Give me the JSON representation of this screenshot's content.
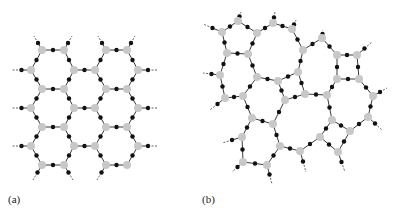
{
  "figure": {
    "panels": [
      {
        "id": "a",
        "label": "(a)",
        "description": "Crystalline network (ordered hexagonal rings)",
        "label_pos": [
          8,
          203
        ],
        "nodes": [
          [
            42,
            50
          ],
          [
            64,
            50
          ],
          [
            106,
            50
          ],
          [
            127,
            50
          ],
          [
            31,
            70
          ],
          [
            74,
            70
          ],
          [
            95,
            70
          ],
          [
            138,
            70
          ],
          [
            42,
            89
          ],
          [
            64,
            89
          ],
          [
            106,
            89
          ],
          [
            127,
            89
          ],
          [
            31,
            108
          ],
          [
            74,
            108
          ],
          [
            95,
            108
          ],
          [
            138,
            108
          ],
          [
            42,
            127
          ],
          [
            64,
            127
          ],
          [
            106,
            127
          ],
          [
            127,
            127
          ],
          [
            31,
            146
          ],
          [
            74,
            146
          ],
          [
            95,
            146
          ],
          [
            138,
            146
          ],
          [
            42,
            165
          ],
          [
            64,
            165
          ],
          [
            106,
            165
          ],
          [
            127,
            165
          ]
        ],
        "edges": [
          [
            0,
            1
          ],
          [
            2,
            3
          ],
          [
            0,
            4
          ],
          [
            1,
            5
          ],
          [
            2,
            6
          ],
          [
            3,
            7
          ],
          [
            5,
            6
          ],
          [
            4,
            8
          ],
          [
            5,
            9
          ],
          [
            6,
            10
          ],
          [
            7,
            11
          ],
          [
            8,
            9
          ],
          [
            10,
            11
          ],
          [
            8,
            12
          ],
          [
            9,
            13
          ],
          [
            10,
            14
          ],
          [
            11,
            15
          ],
          [
            13,
            14
          ],
          [
            12,
            16
          ],
          [
            13,
            17
          ],
          [
            14,
            18
          ],
          [
            15,
            19
          ],
          [
            16,
            17
          ],
          [
            18,
            19
          ],
          [
            16,
            20
          ],
          [
            17,
            21
          ],
          [
            18,
            22
          ],
          [
            19,
            23
          ],
          [
            21,
            22
          ],
          [
            20,
            24
          ],
          [
            21,
            25
          ],
          [
            22,
            26
          ],
          [
            23,
            27
          ],
          [
            24,
            25
          ],
          [
            26,
            27
          ]
        ],
        "dangling": [
          [
            42,
            50,
            34,
            36
          ],
          [
            64,
            50,
            72,
            36
          ],
          [
            106,
            50,
            98,
            36
          ],
          [
            127,
            50,
            135,
            36
          ],
          [
            31,
            70,
            12,
            70
          ],
          [
            138,
            70,
            158,
            70
          ],
          [
            31,
            108,
            12,
            108
          ],
          [
            138,
            108,
            158,
            108
          ],
          [
            31,
            146,
            12,
            146
          ],
          [
            138,
            146,
            158,
            146
          ],
          [
            42,
            165,
            33,
            180
          ],
          [
            74,
            146,
            74,
            146
          ],
          [
            64,
            165,
            73,
            180
          ],
          [
            106,
            165,
            97,
            180
          ]
        ]
      },
      {
        "id": "b",
        "label": "(b)",
        "description": "Amorphous network (random rings)",
        "label_pos": [
          202,
          203
        ],
        "nodes": [
          [
            238,
            21
          ],
          [
            273,
            23
          ],
          [
            292,
            29
          ],
          [
            222,
            32
          ],
          [
            257,
            33
          ],
          [
            322,
            38
          ],
          [
            303,
            50
          ],
          [
            227,
            53
          ],
          [
            248,
            54
          ],
          [
            337,
            55
          ],
          [
            357,
            55
          ],
          [
            220,
            75
          ],
          [
            257,
            77
          ],
          [
            278,
            81
          ],
          [
            298,
            72
          ],
          [
            337,
            79
          ],
          [
            359,
            79
          ],
          [
            225,
            98
          ],
          [
            243,
            96
          ],
          [
            285,
            100
          ],
          [
            305,
            94
          ],
          [
            327,
            95
          ],
          [
            373,
            96
          ],
          [
            252,
            118
          ],
          [
            273,
            124
          ],
          [
            332,
            120
          ],
          [
            368,
            117
          ],
          [
            350,
            131
          ],
          [
            242,
            137
          ],
          [
            280,
            146
          ],
          [
            300,
            151
          ],
          [
            320,
            137
          ],
          [
            338,
            152
          ],
          [
            243,
            162
          ],
          [
            267,
            165
          ]
        ],
        "edges": [
          [
            0,
            3
          ],
          [
            0,
            4
          ],
          [
            3,
            7
          ],
          [
            4,
            8
          ],
          [
            7,
            8
          ],
          [
            4,
            1
          ],
          [
            1,
            2
          ],
          [
            2,
            6
          ],
          [
            6,
            5
          ],
          [
            5,
            9
          ],
          [
            9,
            10
          ],
          [
            9,
            15
          ],
          [
            10,
            16
          ],
          [
            15,
            16
          ],
          [
            7,
            11
          ],
          [
            11,
            17
          ],
          [
            17,
            18
          ],
          [
            18,
            12
          ],
          [
            8,
            12
          ],
          [
            6,
            14
          ],
          [
            14,
            13
          ],
          [
            12,
            13
          ],
          [
            13,
            19
          ],
          [
            14,
            20
          ],
          [
            19,
            20
          ],
          [
            20,
            21
          ],
          [
            21,
            15
          ],
          [
            16,
            22
          ],
          [
            22,
            26
          ],
          [
            26,
            27
          ],
          [
            21,
            25
          ],
          [
            25,
            27
          ],
          [
            25,
            31
          ],
          [
            27,
            32
          ],
          [
            31,
            32
          ],
          [
            31,
            30
          ],
          [
            30,
            29
          ],
          [
            29,
            24
          ],
          [
            24,
            19
          ],
          [
            24,
            23
          ],
          [
            23,
            18
          ],
          [
            23,
            28
          ],
          [
            28,
            33
          ],
          [
            33,
            34
          ],
          [
            34,
            29
          ]
        ],
        "dangling": [
          [
            238,
            21,
            241,
            12
          ],
          [
            273,
            23,
            275,
            12
          ],
          [
            292,
            29,
            296,
            20
          ],
          [
            222,
            32,
            203,
            24
          ],
          [
            322,
            38,
            323,
            30
          ],
          [
            357,
            55,
            372,
            42
          ],
          [
            220,
            75,
            203,
            73
          ],
          [
            373,
            96,
            387,
            88
          ],
          [
            368,
            117,
            382,
            130
          ],
          [
            242,
            137,
            222,
            143
          ],
          [
            225,
            98,
            210,
            110
          ],
          [
            300,
            151,
            306,
            172
          ],
          [
            338,
            152,
            345,
            172
          ],
          [
            243,
            162,
            232,
            172
          ],
          [
            267,
            165,
            272,
            184
          ]
        ]
      }
    ],
    "colors": {
      "bond": "#3a3a3a",
      "bridge_atom": "#111111",
      "network_atom": "#c8c8c8",
      "background": "#ffffff"
    }
  }
}
